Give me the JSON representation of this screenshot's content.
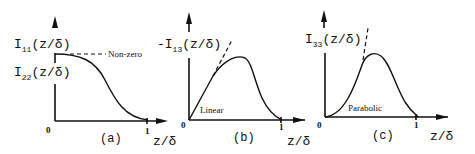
{
  "panels": [
    {
      "caption": "(a)",
      "ylabel_1_main": "I",
      "ylabel_1_sub": "11",
      "ylabel_1_arg": "(z/δ)",
      "ylabel_2_main": "I",
      "ylabel_2_sub": "22",
      "ylabel_2_arg": "(z/δ)",
      "annotation": "Non-zero",
      "x_origin": "0",
      "x_tick": "1",
      "xlabel": "z/δ"
    },
    {
      "caption": "(b)",
      "ylabel_main": "-I",
      "ylabel_sub": "13",
      "ylabel_arg": "(z/δ)",
      "annotation": "Linear",
      "x_origin": "0",
      "x_tick": "1",
      "xlabel": "z/δ"
    },
    {
      "caption": "(c)",
      "ylabel_main": "I",
      "ylabel_sub": "33",
      "ylabel_arg": "(z/δ)",
      "annotation": "Parabolic",
      "x_origin": "0",
      "x_tick": "1",
      "xlabel": "z/δ"
    }
  ]
}
